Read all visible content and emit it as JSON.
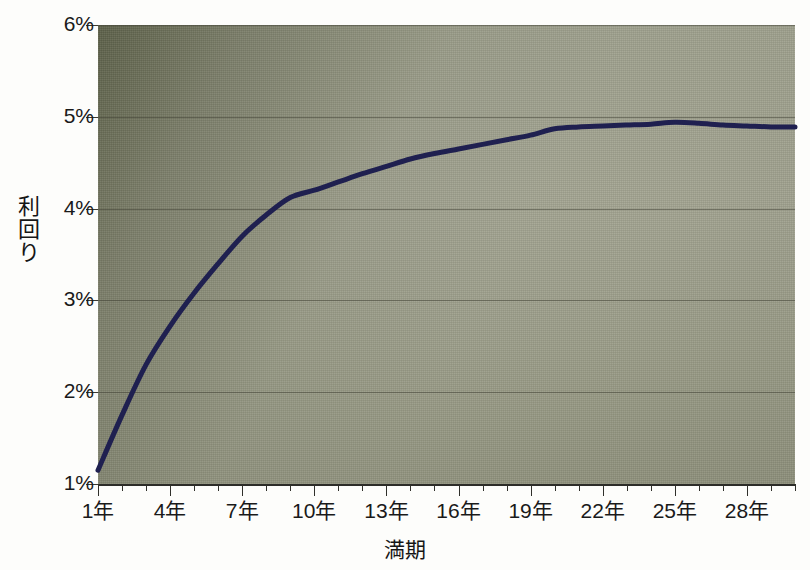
{
  "figure": {
    "top_clipped_text": "",
    "background_color": "#9ea08c",
    "page_background": "#fdfdfb"
  },
  "axis": {
    "y_title_chars": [
      "利",
      "回",
      "り"
    ],
    "y_title": "利回り",
    "x_title": "満期"
  },
  "chart_data": {
    "type": "line",
    "title": "",
    "subtitle": "",
    "xlabel": "満期",
    "ylabel": "利回り",
    "xlim": [
      1,
      30
    ],
    "ylim": [
      1,
      6
    ],
    "grid": true,
    "legend": "none",
    "x_tick_labels": [
      "1年",
      "4年",
      "7年",
      "10年",
      "13年",
      "16年",
      "19年",
      "22年",
      "25年",
      "28年"
    ],
    "x_tick_values": [
      1,
      4,
      7,
      10,
      13,
      16,
      19,
      22,
      25,
      28
    ],
    "y_tick_labels": [
      "1%",
      "2%",
      "3%",
      "4%",
      "5%",
      "6%"
    ],
    "y_tick_values": [
      1,
      2,
      3,
      4,
      5,
      6
    ],
    "y_unit": "%",
    "minor_tick_interval_x": 1,
    "series": [
      {
        "name": "利回り曲線",
        "color": "#1f2050",
        "line_width": 5,
        "x": [
          1,
          2,
          3,
          4,
          5,
          6,
          7,
          8,
          9,
          10,
          11,
          12,
          13,
          14,
          15,
          16,
          17,
          18,
          19,
          20,
          21,
          22,
          23,
          24,
          25,
          26,
          27,
          28,
          29,
          30
        ],
        "values": [
          1.15,
          1.75,
          2.3,
          2.72,
          3.08,
          3.4,
          3.7,
          3.93,
          4.12,
          4.2,
          4.29,
          4.38,
          4.46,
          4.54,
          4.6,
          4.65,
          4.7,
          4.75,
          4.8,
          4.87,
          4.89,
          4.9,
          4.91,
          4.92,
          4.94,
          4.93,
          4.91,
          4.9,
          4.89,
          4.89
        ]
      }
    ]
  }
}
